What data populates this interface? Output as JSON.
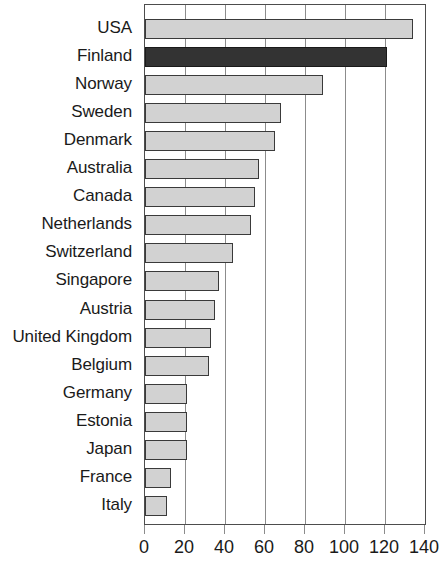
{
  "chart_data": {
    "type": "bar",
    "orientation": "horizontal",
    "title": "",
    "subtitle": "",
    "xlabel": "",
    "ylabel": "",
    "xlim": [
      0,
      140
    ],
    "ylim": null,
    "grid": true,
    "legend": null,
    "xticks": [
      "0",
      "20",
      "40",
      "60",
      "80",
      "100",
      "120",
      "140"
    ],
    "xtick_values": [
      0,
      20,
      40,
      60,
      80,
      100,
      120,
      140
    ],
    "categories": [
      "USA",
      "Finland",
      "Norway",
      "Sweden",
      "Denmark",
      "Australia",
      "Canada",
      "Netherlands",
      "Switzerland",
      "Singapore",
      "Austria",
      "United Kingdom",
      "Belgium",
      "Germany",
      "Estonia",
      "Japan",
      "France",
      "Italy"
    ],
    "values": [
      134,
      121,
      89,
      68,
      65,
      57,
      55,
      53,
      44,
      37,
      35,
      33,
      32,
      21,
      21,
      21,
      13,
      11
    ],
    "highlight_category": "Finland",
    "colors": {
      "bar": "#d2d2d2",
      "bar_highlight": "#333333",
      "bar_edge": "#3a3a3a",
      "gridline": "#8c8c8c",
      "axis": "#4d4d4d",
      "text": "#1a1a1a",
      "background": "#ffffff"
    }
  }
}
